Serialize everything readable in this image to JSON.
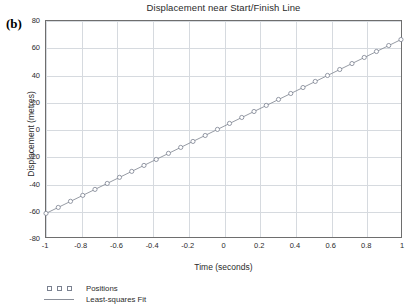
{
  "panel": {
    "label": "(b)"
  },
  "chart_data": {
    "type": "scatter",
    "title": "Displacement near Start/Finish Line",
    "xlabel": "Time (seconds)",
    "ylabel": "Displacement (metres)",
    "xlim": [
      -1,
      1
    ],
    "ylim": [
      -80,
      80
    ],
    "xticks": [
      -1,
      -0.8,
      -0.6,
      -0.4,
      -0.2,
      0,
      0.2,
      0.4,
      0.6,
      0.8,
      1
    ],
    "xtick_labels": [
      "-1",
      "-0.8",
      "-0.6",
      "-0.4",
      "-0.2",
      "0",
      "0.2",
      "0.4",
      "0.6",
      "0.8",
      "1"
    ],
    "yticks": [
      80,
      60,
      40,
      20,
      0,
      -20,
      -40,
      -60,
      -80
    ],
    "ytick_labels": [
      "80",
      "60",
      "40",
      "20",
      "0",
      "-20",
      "-40",
      "-60",
      "-80"
    ],
    "grid": true,
    "grid_x_step": 0.2,
    "grid_y_step": 20,
    "legend_position": "below-left",
    "series": [
      {
        "name": "Positions",
        "marker": "open-circle",
        "color": "#7a8190",
        "x": [
          -1.0,
          -0.931,
          -0.862,
          -0.793,
          -0.724,
          -0.655,
          -0.586,
          -0.517,
          -0.448,
          -0.379,
          -0.31,
          -0.241,
          -0.172,
          -0.103,
          -0.034,
          0.034,
          0.103,
          0.172,
          0.241,
          0.31,
          0.379,
          0.448,
          0.517,
          0.586,
          0.655,
          0.724,
          0.793,
          0.862,
          0.931,
          1.0
        ],
        "y": [
          -62.0,
          -57.6,
          -53.1,
          -48.7,
          -44.3,
          -39.9,
          -35.4,
          -31.0,
          -26.6,
          -22.2,
          -17.7,
          -13.3,
          -8.9,
          -4.5,
          0.0,
          4.4,
          8.8,
          13.2,
          17.7,
          22.1,
          26.5,
          30.9,
          35.4,
          39.8,
          44.2,
          48.6,
          53.1,
          57.5,
          61.9,
          66.3
        ]
      },
      {
        "name": "Least-squares Fit",
        "marker": "line",
        "color": "#8a8f99",
        "slope": 64.15,
        "intercept": 2.15,
        "x": [
          -1.0,
          1.0
        ],
        "y": [
          -62.0,
          66.3
        ]
      }
    ],
    "legend": [
      {
        "label": "Positions",
        "key": "markers"
      },
      {
        "label": "Least-squares Fit",
        "key": "line"
      }
    ]
  }
}
